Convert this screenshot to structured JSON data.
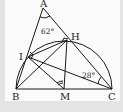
{
  "diagram": {
    "type": "geometry",
    "points": {
      "A": {
        "label": "A",
        "x": 43,
        "y": 8
      },
      "H": {
        "label": "H",
        "x": 67,
        "y": 40
      },
      "I": {
        "label": "I",
        "x": 28,
        "y": 57
      },
      "B": {
        "label": "B",
        "x": 16,
        "y": 89
      },
      "M": {
        "label": "M",
        "x": 64,
        "y": 89
      },
      "C": {
        "label": "C",
        "x": 112,
        "y": 89
      }
    },
    "angles": {
      "A": "62°",
      "C": "28°"
    },
    "colors": {
      "stroke": "#1a1a1a",
      "paper": "#fbfbfb",
      "background": "#e4e4e4"
    }
  }
}
